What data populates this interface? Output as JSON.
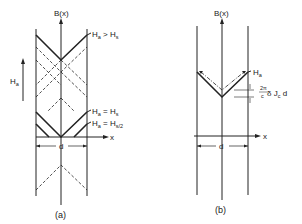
{
  "panel_a": {
    "yaxis_label": "B(x)",
    "xaxis_label": "x",
    "field_label": "H",
    "field_sub": "a",
    "width_label": "d",
    "caption": "(a)",
    "curves": [
      {
        "label_main": "H",
        "label_sub": "a",
        "relation": " > H",
        "rel_sub": "s"
      },
      {
        "label_main": "H",
        "label_sub": "a",
        "relation": " = H",
        "rel_sub": "s"
      },
      {
        "label_main": "H",
        "label_sub": "a",
        "relation": " = H",
        "rel_sub": "s/2"
      }
    ]
  },
  "panel_b": {
    "yaxis_label": "B(x)",
    "xaxis_label": "x",
    "width_label": "d",
    "caption": "(b)",
    "curve_label_main": "H",
    "curve_label_sub": "a",
    "delta_num": "2π",
    "delta_den": "c",
    "delta_rest": " δ J",
    "delta_sub": "c",
    "delta_tail": " d"
  }
}
